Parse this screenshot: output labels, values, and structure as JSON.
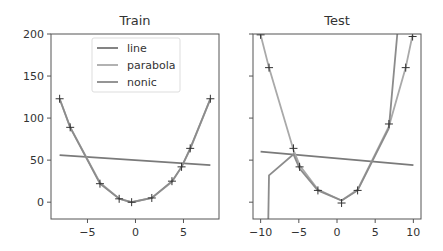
{
  "chart_data": [
    {
      "type": "line",
      "title": "Train",
      "xlabel": "",
      "ylabel": "",
      "xlim": [
        -8.8,
        8.7
      ],
      "ylim": [
        -20,
        200
      ],
      "xticks": [
        -5,
        0,
        5
      ],
      "yticks": [
        0,
        50,
        100,
        150,
        200
      ],
      "grid": false,
      "legend_position": "upper center",
      "points": {
        "x": [
          -7.9,
          -6.8,
          -3.7,
          -1.7,
          -0.4,
          1.7,
          3.8,
          4.8,
          5.7,
          7.8
        ],
        "y": [
          123,
          89,
          22,
          4,
          0,
          5,
          25,
          42,
          64,
          123
        ]
      },
      "series": [
        {
          "name": "line",
          "x": [
            -7.9,
            7.8
          ],
          "y": [
            56,
            44
          ]
        },
        {
          "name": "parabola",
          "x": [
            -7.9,
            -6.8,
            -3.7,
            -1.7,
            -0.4,
            1.7,
            3.8,
            4.8,
            5.7,
            7.8
          ],
          "y": [
            123,
            89,
            23,
            4,
            0,
            5,
            24,
            42,
            63,
            123
          ]
        },
        {
          "name": "nonic",
          "x": [
            -7.9,
            -6.8,
            -3.7,
            -1.7,
            -0.4,
            1.7,
            3.8,
            4.8,
            5.7,
            7.8
          ],
          "y": [
            123,
            89,
            22,
            4,
            0,
            5,
            25,
            42,
            64,
            123
          ]
        }
      ]
    },
    {
      "type": "line",
      "title": "Test",
      "xlabel": "",
      "ylabel": "",
      "xlim": [
        -11,
        11
      ],
      "ylim": [
        -20,
        200
      ],
      "xticks": [
        -10,
        -5,
        0,
        5,
        10
      ],
      "yticks": [
        0,
        50,
        100,
        150,
        200
      ],
      "ytick_labels_visible": false,
      "grid": false,
      "points": {
        "x": [
          -10,
          -8.9,
          -5.7,
          -4.9,
          -2.5,
          0.6,
          2.7,
          6.8,
          9.0,
          9.9
        ],
        "y": [
          199,
          160,
          64,
          42,
          14,
          -1,
          14,
          93,
          160,
          197
        ]
      },
      "series": [
        {
          "name": "line",
          "x": [
            -10,
            10
          ],
          "y": [
            60,
            44
          ]
        },
        {
          "name": "parabola",
          "x": [
            -10,
            -8.9,
            -5.7,
            -4.9,
            -2.5,
            0.6,
            2.7,
            6.8,
            9.0,
            9.9
          ],
          "y": [
            199,
            160,
            62,
            44,
            15,
            2,
            15,
            90,
            160,
            199
          ]
        },
        {
          "name": "nonic",
          "x": [
            -9.0,
            -8.9,
            -5.7,
            -4.9,
            -2.5,
            0.6,
            2.7,
            6.8,
            7.9
          ],
          "y": [
            -20,
            32,
            57,
            40,
            14,
            2,
            14,
            88,
            200
          ]
        }
      ]
    }
  ],
  "legend": {
    "entries": [
      {
        "label": "line",
        "color": "#777777"
      },
      {
        "label": "parabola",
        "color": "#aaaaaa"
      },
      {
        "label": "nonic",
        "color": "#8a8a8a"
      }
    ]
  },
  "colors": {
    "line": "#7a7a7a",
    "parabola": "#a9a9a9",
    "nonic": "#8c8c8c",
    "marker": "#333333",
    "axes": "#555555"
  },
  "titles": {
    "train": "Train",
    "test": "Test"
  }
}
